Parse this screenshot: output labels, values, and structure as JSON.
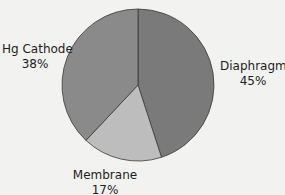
{
  "chart_data": {
    "type": "pie",
    "title": "",
    "categories": [
      "Diaphragm",
      "Membrane",
      "Hg Cathode"
    ],
    "values": [
      45,
      17,
      38
    ],
    "unit": "%",
    "labels": [
      {
        "name": "Diaphragm",
        "value": "45%"
      },
      {
        "name": "Membrane",
        "value": "17%"
      },
      {
        "name": "Hg Cathode",
        "value": "38%"
      }
    ],
    "colors": {
      "Diaphragm": "#7a7a7a",
      "Membrane": "#bdbdbd",
      "Hg Cathode": "#8a8a8a"
    },
    "start_angle": "12 o'clock",
    "direction": "clockwise",
    "legend": "none (direct labels)"
  }
}
